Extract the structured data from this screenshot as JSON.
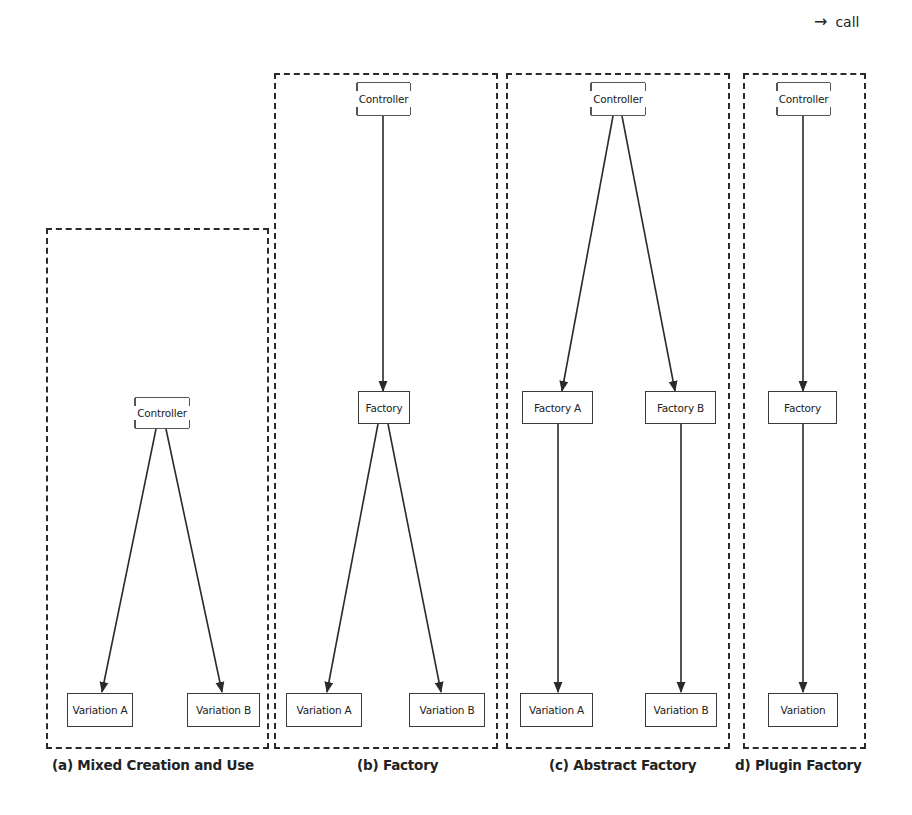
{
  "legend": {
    "arrow_icon": "→",
    "label": "call"
  },
  "panels": [
    {
      "id": "a",
      "caption": "(a) Mixed Creation and Use",
      "nodes": {
        "controller": "Controller",
        "variation_a": "Variation A",
        "variation_b": "Variation B"
      }
    },
    {
      "id": "b",
      "caption": "(b) Factory",
      "nodes": {
        "controller": "Controller",
        "factory": "Factory",
        "variation_a": "Variation A",
        "variation_b": "Variation B"
      }
    },
    {
      "id": "c",
      "caption": "(c) Abstract Factory",
      "nodes": {
        "controller": "Controller",
        "factory_a": "Factory A",
        "factory_b": "Factory B",
        "variation_a": "Variation A",
        "variation_b": "Variation B"
      }
    },
    {
      "id": "d",
      "caption": "d) Plugin Factory",
      "nodes": {
        "controller": "Controller",
        "factory": "Factory",
        "variation": "Variation"
      }
    }
  ],
  "edges": [
    {
      "panel": "a",
      "from": "Controller",
      "to": "Variation A",
      "type": "call"
    },
    {
      "panel": "a",
      "from": "Controller",
      "to": "Variation B",
      "type": "call"
    },
    {
      "panel": "b",
      "from": "Controller",
      "to": "Factory",
      "type": "call"
    },
    {
      "panel": "b",
      "from": "Factory",
      "to": "Variation A",
      "type": "call"
    },
    {
      "panel": "b",
      "from": "Factory",
      "to": "Variation B",
      "type": "call"
    },
    {
      "panel": "c",
      "from": "Controller",
      "to": "Factory A",
      "type": "call"
    },
    {
      "panel": "c",
      "from": "Controller",
      "to": "Factory B",
      "type": "call"
    },
    {
      "panel": "c",
      "from": "Factory A",
      "to": "Variation A",
      "type": "call"
    },
    {
      "panel": "c",
      "from": "Factory B",
      "to": "Variation B",
      "type": "call"
    },
    {
      "panel": "d",
      "from": "Controller",
      "to": "Factory",
      "type": "call"
    },
    {
      "panel": "d",
      "from": "Factory",
      "to": "Variation",
      "type": "call"
    }
  ],
  "colors": {
    "stroke": "#2a2a2a",
    "text": "#222222",
    "background": "#ffffff"
  }
}
